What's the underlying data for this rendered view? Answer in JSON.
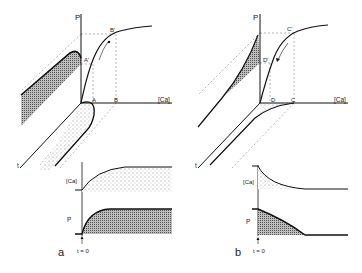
{
  "panel_a": {
    "id_label": "a",
    "axis_p": "P",
    "axis_ca": "[Ca]",
    "axis_t": "t",
    "point_A": "A",
    "point_B": "B",
    "point_A_prime": "A'",
    "point_B_prime": "B'",
    "trace_ca_label": "[Ca]",
    "trace_p_label": "P",
    "time_marker": "t = 0"
  },
  "panel_b": {
    "id_label": "b",
    "axis_p": "P",
    "axis_ca": "[Ca]",
    "axis_t": "t",
    "point_C": "C",
    "point_D": "D",
    "point_C_prime": "C'",
    "point_D_prime": "D'",
    "trace_ca_label": "[Ca]",
    "trace_p_label": "P",
    "time_marker": "t = 0"
  },
  "colors": {
    "ink": "#111111",
    "dashed": "#888888",
    "background": "#ffffff"
  }
}
